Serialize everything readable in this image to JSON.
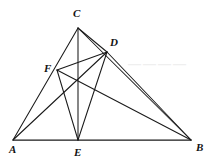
{
  "figure": {
    "background_color": "#ffffff",
    "stroke_color": "#1a1a1a",
    "watermark": {
      "text": "————",
      "color": "#efefef",
      "x": 128,
      "y": 68
    },
    "labels": [
      {
        "name": "A",
        "text": "A",
        "x": 9,
        "y": 153,
        "anchor": "start"
      },
      {
        "name": "B",
        "text": "B",
        "x": 196,
        "y": 151,
        "anchor": "start"
      },
      {
        "name": "C",
        "text": "C",
        "x": 73,
        "y": 17,
        "anchor": "start"
      },
      {
        "name": "D",
        "text": "D",
        "x": 110,
        "y": 46,
        "anchor": "start"
      },
      {
        "name": "E",
        "text": "E",
        "x": 74,
        "y": 156,
        "anchor": "start"
      },
      {
        "name": "F",
        "text": "F",
        "x": 44,
        "y": 72,
        "anchor": "start"
      }
    ],
    "points": {
      "A": {
        "x": 13,
        "y": 140
      },
      "B": {
        "x": 191,
        "y": 140
      },
      "C": {
        "x": 78,
        "y": 28
      },
      "D": {
        "x": 107,
        "y": 52
      },
      "E": {
        "x": 78,
        "y": 140
      },
      "F": {
        "x": 57,
        "y": 70
      }
    },
    "segments": [
      {
        "name": "segment-AB",
        "from": "A",
        "to": "B",
        "kind": "base"
      },
      {
        "name": "segment-AC",
        "from": "A",
        "to": "C",
        "kind": "normal"
      },
      {
        "name": "segment-CB",
        "from": "C",
        "to": "B",
        "kind": "normal"
      },
      {
        "name": "segment-CE",
        "from": "C",
        "to": "E",
        "kind": "normal"
      },
      {
        "name": "segment-CD",
        "from": "C",
        "to": "D",
        "kind": "normal"
      },
      {
        "name": "segment-AD",
        "from": "A",
        "to": "D",
        "kind": "normal"
      },
      {
        "name": "segment-DE",
        "from": "D",
        "to": "E",
        "kind": "normal"
      },
      {
        "name": "segment-DF",
        "from": "D",
        "to": "F",
        "kind": "normal"
      },
      {
        "name": "segment-DB",
        "from": "D",
        "to": "B",
        "kind": "normal"
      },
      {
        "name": "segment-FE",
        "from": "F",
        "to": "E",
        "kind": "normal"
      },
      {
        "name": "segment-FB",
        "from": "F",
        "to": "B",
        "kind": "normal"
      }
    ]
  }
}
